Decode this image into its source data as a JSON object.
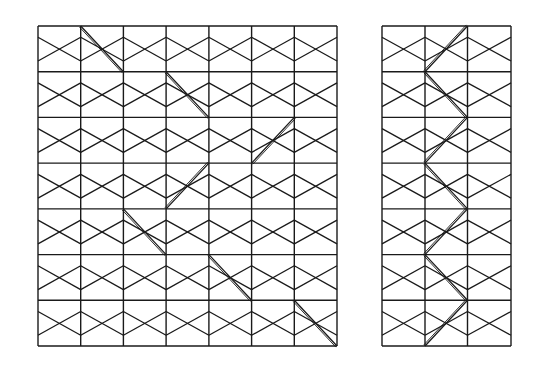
{
  "diagram": {
    "line_color": "#1a1a1a",
    "background": "#ffffff",
    "panels": [
      {
        "name": "left-lattice",
        "columns": 7,
        "rows": 7,
        "x_lines": [
          38,
          80.7,
          123.4,
          166.1,
          208.9,
          251.6,
          294.3,
          337
        ],
        "y_lines": [
          26,
          71.7,
          117.4,
          163.1,
          208.9,
          254.6,
          300.3,
          346
        ],
        "path_segments": [
          [
            [
              80.7,
              26
            ],
            [
              123.4,
              71.7
            ]
          ],
          [
            [
              166.1,
              71.7
            ],
            [
              208.9,
              117.4
            ]
          ],
          [
            [
              251.6,
              163.1
            ],
            [
              294.3,
              117.4
            ]
          ],
          [
            [
              208.9,
              163.1
            ],
            [
              166.1,
              208.9
            ]
          ],
          [
            [
              123.4,
              208.9
            ],
            [
              166.1,
              254.6
            ]
          ],
          [
            [
              208.9,
              254.6
            ],
            [
              251.6,
              300.3
            ]
          ],
          [
            [
              294.3,
              300.3
            ],
            [
              337,
              346
            ]
          ]
        ]
      },
      {
        "name": "right-lattice",
        "columns": 3,
        "rows": 7,
        "x_lines": [
          382,
          425,
          467.5,
          511
        ],
        "y_lines": [
          26,
          71.7,
          117.4,
          163.1,
          208.9,
          254.6,
          300.3,
          346
        ],
        "path_segments": [
          [
            [
              467.5,
              26
            ],
            [
              425,
              71.7
            ]
          ],
          [
            [
              425,
              71.7
            ],
            [
              467.5,
              117.4
            ]
          ],
          [
            [
              467.5,
              117.4
            ],
            [
              425,
              163.1
            ]
          ],
          [
            [
              425,
              163.1
            ],
            [
              467.5,
              208.9
            ]
          ],
          [
            [
              467.5,
              208.9
            ],
            [
              425,
              254.6
            ]
          ],
          [
            [
              425,
              254.6
            ],
            [
              467.5,
              300.3
            ]
          ],
          [
            [
              467.5,
              300.3
            ],
            [
              425,
              346
            ]
          ]
        ]
      }
    ],
    "diagonal_offsets": {
      "upper": 0.245,
      "lower": 0.765
    }
  }
}
